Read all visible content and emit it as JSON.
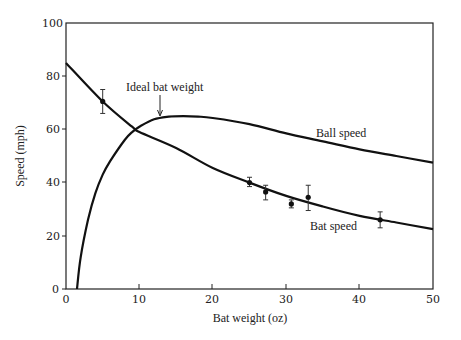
{
  "chart_data": {
    "type": "line",
    "title": "",
    "xlabel": "Bat weight (oz)",
    "ylabel": "Speed (mph)",
    "xlim": [
      0,
      50
    ],
    "ylim": [
      0,
      100
    ],
    "xticks": [
      0,
      10,
      20,
      30,
      40,
      50
    ],
    "yticks": [
      0,
      20,
      40,
      60,
      80,
      100
    ],
    "grid": false,
    "legend": "none (curves labeled inline)",
    "series": [
      {
        "name": "Ball speed",
        "type": "line",
        "x": [
          1.5,
          2,
          3,
          4,
          5,
          6,
          8,
          9,
          10,
          12,
          14,
          16,
          18,
          20,
          25,
          30,
          35,
          40,
          45,
          50
        ],
        "values": [
          0,
          12,
          26,
          36,
          43,
          48,
          56,
          59,
          61,
          63.8,
          64.8,
          65,
          64.8,
          64.3,
          62,
          58.5,
          55.5,
          52.5,
          50,
          47.5
        ]
      },
      {
        "name": "Bat speed",
        "type": "line",
        "x": [
          0,
          5,
          9,
          10,
          15,
          20,
          25,
          30,
          35,
          40,
          45,
          50
        ],
        "values": [
          85,
          70.5,
          61,
          59,
          53,
          45.5,
          40,
          35,
          31,
          27.5,
          25,
          22.5
        ]
      },
      {
        "name": "Measured bat speed",
        "type": "scatter",
        "x": [
          5,
          25,
          27.2,
          30.7,
          33,
          42.8
        ],
        "values": [
          70.5,
          40,
          36.5,
          32,
          34.5,
          26
        ],
        "err_low": [
          66,
          38.5,
          33.5,
          30.5,
          29.5,
          23
        ],
        "err_high": [
          75,
          42,
          39,
          33.5,
          39,
          29
        ]
      }
    ],
    "annotations": [
      {
        "text": "Ideal bat weight",
        "arrow_to_x": 12.8,
        "arrow_to_y": 65
      },
      {
        "text": "Ball speed",
        "x": 38,
        "y": 57
      },
      {
        "text": "Bat speed",
        "x": 33,
        "y": 20.5
      }
    ]
  },
  "labels": {
    "xlabel": "Bat weight (oz)",
    "ylabel": "Speed (mph)",
    "ideal": "Ideal bat weight",
    "ball": "Ball speed",
    "bat": "Bat speed"
  },
  "xtick_labels": [
    "0",
    "10",
    "20",
    "30",
    "40",
    "50"
  ],
  "ytick_labels": [
    "0",
    "20",
    "40",
    "60",
    "80",
    "100"
  ]
}
